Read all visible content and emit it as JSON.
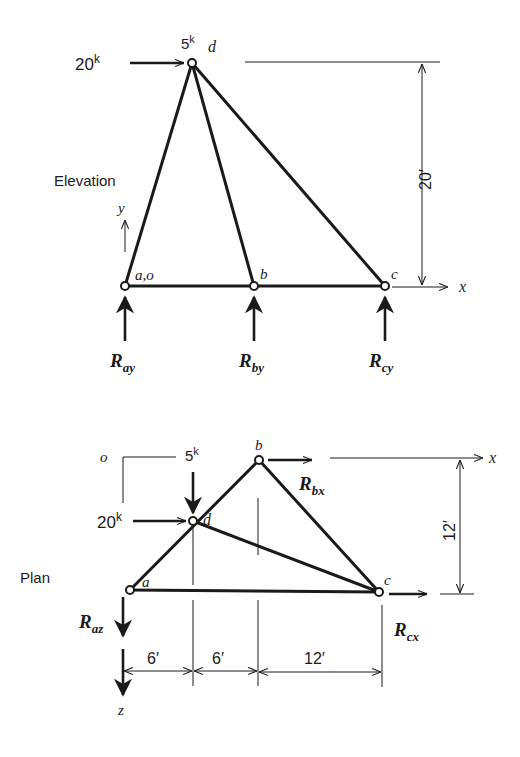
{
  "elevation": {
    "view_label": "Elevation",
    "joints": {
      "a": {
        "label": "a,o"
      },
      "b": {
        "label": "b"
      },
      "c": {
        "label": "c"
      },
      "d": {
        "label": "d"
      }
    },
    "loads": {
      "horizontal": {
        "value": "20",
        "unit": "k"
      },
      "vertical": {
        "value": "5",
        "unit": "k"
      }
    },
    "reactions": {
      "a": {
        "symbol": "R",
        "sub": "ay"
      },
      "b": {
        "symbol": "R",
        "sub": "by"
      },
      "c": {
        "symbol": "R",
        "sub": "cy"
      }
    },
    "axes": {
      "x": "x",
      "y": "y"
    },
    "dimensions": {
      "height": "20′"
    }
  },
  "plan": {
    "view_label": "Plan",
    "origin_label": "o",
    "joints": {
      "a": {
        "label": "a"
      },
      "b": {
        "label": "b"
      },
      "c": {
        "label": "c"
      },
      "d": {
        "label": "d"
      }
    },
    "loads": {
      "horizontal": {
        "value": "20",
        "unit": "k"
      },
      "vertical": {
        "value": "5",
        "unit": "k"
      }
    },
    "reactions": {
      "a": {
        "symbol": "R",
        "sub": "az"
      },
      "b": {
        "symbol": "R",
        "sub": "bx"
      },
      "c": {
        "symbol": "R",
        "sub": "cx"
      }
    },
    "axes": {
      "x": "x",
      "z": "z"
    },
    "dimensions": {
      "depth": "12′",
      "spans": [
        "6′",
        "6′",
        "12′"
      ]
    }
  },
  "colors": {
    "ink": "#1a1a1a",
    "background": "#ffffff"
  }
}
